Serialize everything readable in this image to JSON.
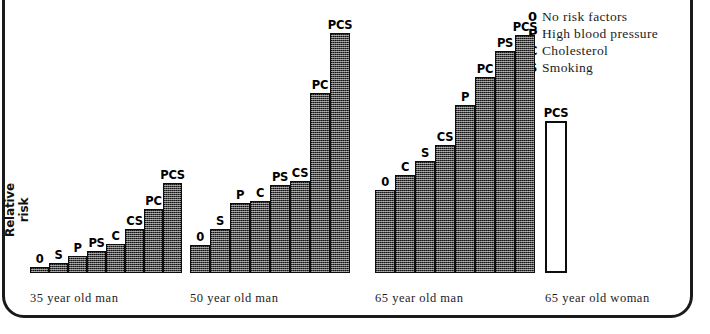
{
  "chart_data": {
    "type": "bar",
    "title": "",
    "subtitle": "",
    "xlabel": "",
    "ylabel": "Relative risk",
    "grid": false,
    "legend_position": "top-right",
    "ylim": [
      0,
      250
    ],
    "axis_note": "y-axis unlabelled; values are relative bar heights in plot units",
    "legend": [
      {
        "key": "0",
        "label": "No risk factors"
      },
      {
        "key": "P",
        "label": "High blood pressure"
      },
      {
        "key": "C",
        "label": "Cholesterol"
      },
      {
        "key": "S",
        "label": "Smoking"
      }
    ],
    "categories": [
      "35 year old man",
      "50 year old man",
      "65 year old man",
      "65 year old woman"
    ],
    "groups": [
      {
        "name": "35 year old man",
        "filled": true,
        "bars": [
          {
            "label": "0",
            "value": 6
          },
          {
            "label": "S",
            "value": 10
          },
          {
            "label": "P",
            "value": 17
          },
          {
            "label": "PS",
            "value": 22
          },
          {
            "label": "C",
            "value": 29
          },
          {
            "label": "CS",
            "value": 44
          },
          {
            "label": "PC",
            "value": 64
          },
          {
            "label": "PCS",
            "value": 90
          }
        ]
      },
      {
        "name": "50 year old man",
        "filled": true,
        "bars": [
          {
            "label": "0",
            "value": 28
          },
          {
            "label": "S",
            "value": 44
          },
          {
            "label": "P",
            "value": 70
          },
          {
            "label": "C",
            "value": 72
          },
          {
            "label": "PS",
            "value": 88
          },
          {
            "label": "CS",
            "value": 92
          },
          {
            "label": "PC",
            "value": 180
          },
          {
            "label": "PCS",
            "value": 240
          }
        ]
      },
      {
        "name": "65 year old man",
        "filled": true,
        "bars": [
          {
            "label": "0",
            "value": 83
          },
          {
            "label": "C",
            "value": 98
          },
          {
            "label": "S",
            "value": 112
          },
          {
            "label": "CS",
            "value": 128
          },
          {
            "label": "P",
            "value": 168
          },
          {
            "label": "PC",
            "value": 196
          },
          {
            "label": "PS",
            "value": 222
          },
          {
            "label": "PCS",
            "value": 238
          }
        ]
      },
      {
        "name": "65 year old woman",
        "filled": false,
        "bars": [
          {
            "label": "PCS",
            "value": 152
          }
        ]
      }
    ]
  },
  "colors": {
    "bar_fill": "#4a4a4a",
    "bar_stroke": "#0d0d0d",
    "hollow_fill": "#ffffff",
    "text": "#1c1c1c",
    "frame": "#1a1a1a"
  },
  "layout": {
    "group_left": [
      30,
      190,
      375,
      545
    ],
    "bar_width": [
      19,
      20,
      20,
      22
    ],
    "baseline_y": 273,
    "y_scale": 1.0
  }
}
